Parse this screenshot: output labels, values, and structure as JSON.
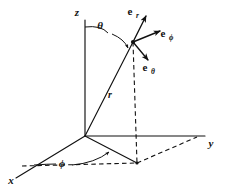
{
  "figure": {
    "background_color": "#ffffff",
    "ink_color": "#111111"
  },
  "axes": {
    "z": {
      "label": "z",
      "x": 77,
      "y": 16
    },
    "y": {
      "label": "y",
      "x": 211,
      "y": 147
    },
    "x": {
      "label": "x",
      "x": 11,
      "y": 184
    }
  },
  "angles": {
    "theta": {
      "label": "θ",
      "x": 100,
      "y": 29
    },
    "phi": {
      "label": "ϕ",
      "x": 62,
      "y": 167
    }
  },
  "radius": {
    "label": "r",
    "x": 110,
    "y": 98
  },
  "unit_vectors": [
    {
      "name": "e-r",
      "base": "e",
      "sub": "r",
      "x": 130,
      "y": 15
    },
    {
      "name": "e-phi",
      "base": "e",
      "sub": "ϕ",
      "x": 160,
      "y": 37
    },
    {
      "name": "e-theta",
      "base": "e",
      "sub": "θ",
      "x": 142,
      "y": 71
    }
  ],
  "geometry": {
    "origin": {
      "x": 85,
      "y": 136
    },
    "point_p": {
      "x": 133,
      "y": 42
    },
    "projection_xy": {
      "x": 137,
      "y": 163
    },
    "z_axis_top": {
      "x": 85,
      "y": 20
    },
    "y_axis_end": {
      "x": 205,
      "y": 136
    },
    "x_axis_end": {
      "x": 16,
      "y": 178
    }
  }
}
